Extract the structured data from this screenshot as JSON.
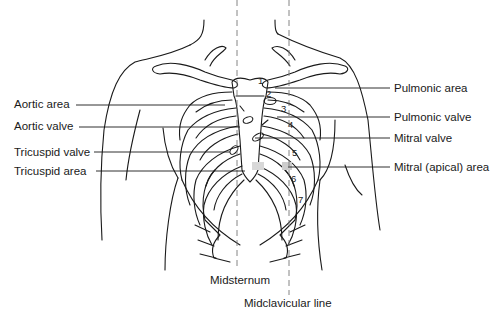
{
  "diagram": {
    "type": "anatomical-illustration",
    "labels_left": [
      {
        "id": "aortic-area",
        "text": "Aortic area"
      },
      {
        "id": "aortic-valve",
        "text": "Aortic valve"
      },
      {
        "id": "tricuspid-valve",
        "text": "Tricuspid valve"
      },
      {
        "id": "tricuspid-area",
        "text": "Tricuspid area"
      }
    ],
    "labels_right": [
      {
        "id": "pulmonic-area",
        "text": "Pulmonic area"
      },
      {
        "id": "pulmonic-valve",
        "text": "Pulmonic valve"
      },
      {
        "id": "mitral-valve",
        "text": "Mitral valve"
      },
      {
        "id": "mitral-apical-area",
        "text": "Mitral (apical) area"
      }
    ],
    "labels_bottom": [
      {
        "id": "midsternum",
        "text": "Midsternum"
      },
      {
        "id": "midclavicular-line",
        "text": "Midclavicular line"
      }
    ],
    "rib_numbers": [
      "1",
      "2",
      "3",
      "4",
      "5",
      "6",
      "7"
    ],
    "colors": {
      "line": "#1a1a1a",
      "dashed": "#777777",
      "shading": "#cccccc",
      "background": "#ffffff"
    }
  }
}
